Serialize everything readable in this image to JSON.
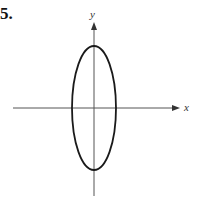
{
  "problem": {
    "number": "5."
  },
  "axes": {
    "x_label": "x",
    "y_label": "y"
  },
  "figure": {
    "shape": "ellipse",
    "center": [
      0,
      0
    ],
    "semi_axis_x": 22,
    "semi_axis_y": 62,
    "stroke_color": "#1a1a1a",
    "axis_color": "#555555"
  }
}
